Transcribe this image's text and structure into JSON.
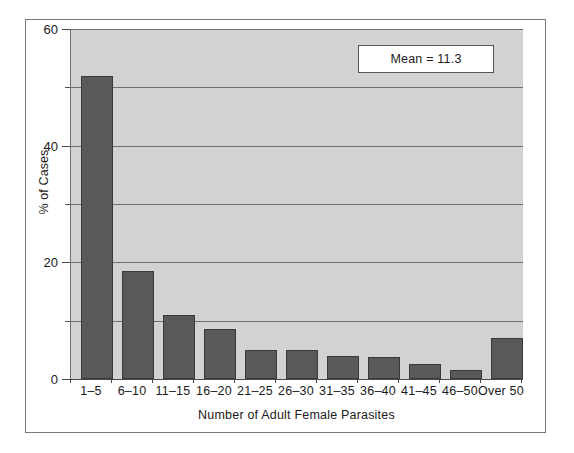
{
  "chart_data": {
    "type": "bar",
    "title": "",
    "subtitle": "",
    "xlabel": "Number of Adult Female Parasites",
    "ylabel": "% of Cases",
    "categories": [
      "1–5",
      "6–10",
      "11–15",
      "16–20",
      "21–25",
      "26–30",
      "31–35",
      "36–40",
      "41–45",
      "46–50",
      "Over 50"
    ],
    "values": [
      52,
      18.5,
      11,
      8.5,
      5,
      5,
      4,
      3.8,
      2.5,
      1.5,
      7
    ],
    "ylim": [
      0,
      60
    ],
    "ytick_labels": [
      "0",
      "20",
      "40",
      "60"
    ],
    "ytick_values": [
      0,
      20,
      40,
      60
    ],
    "gridline_values": [
      10,
      20,
      30,
      40,
      50,
      60
    ],
    "grid": true,
    "legend": "none",
    "annotations": [
      {
        "name": "mean-annotation",
        "text": "Mean = 11.3",
        "value": 11.3
      }
    ],
    "colors": {
      "bar_fill": "#595959",
      "bar_edge": "#3a3a3a",
      "plot_background": "#d2d2d2",
      "figure_background": "#ffffff",
      "gridline": "#6f6f6f",
      "axis": "#4a4a4a",
      "text": "#1a1a1a"
    }
  },
  "axes": {
    "y_title": "% of Cases",
    "x_title": "Number of Adult Female Parasites",
    "y_labels": [
      "60",
      "40",
      "20",
      "0"
    ],
    "x_labels": [
      "1–5",
      "6–10",
      "11–15",
      "16–20",
      "21–25",
      "26–30",
      "31–35",
      "36–40",
      "41–45",
      "46–50",
      "Over 50"
    ]
  },
  "annotation": {
    "mean_label": "Mean = 11.3"
  }
}
